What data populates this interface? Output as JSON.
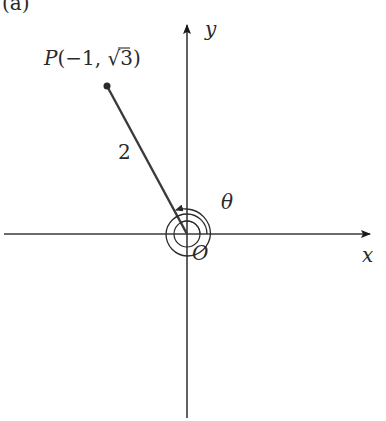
{
  "figure": {
    "panel_label": "(a)",
    "point_label": "P(−1, √3)",
    "point_label_parts": {
      "P": "P",
      "open": "(",
      "x": "−1",
      "sep": ", ",
      "sqrt": "√",
      "rad": "3",
      "close": ")"
    },
    "segment_length_label": "2",
    "angle_label": "θ",
    "origin_label": "O",
    "x_axis_label": "x",
    "y_axis_label": "y",
    "colors": {
      "axis": "#2a2a2a",
      "segment": "#3a3a3a",
      "text": "#2a2a2a"
    }
  }
}
